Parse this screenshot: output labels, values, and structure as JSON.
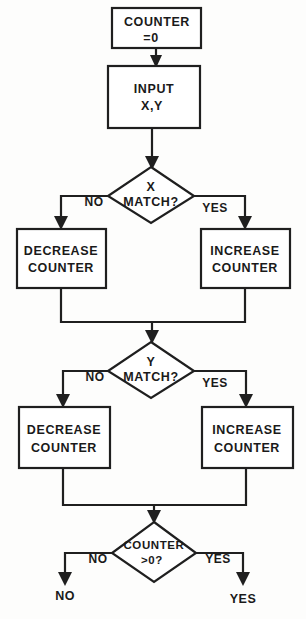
{
  "diagram": {
    "colors": {
      "background": "#fdfdfc",
      "stroke": "#1f1f1f",
      "shape_fill": "#ffffff",
      "text": "#1a1a1a"
    },
    "nodes": {
      "init": {
        "type": "process",
        "line1": "COUNTER",
        "line2": "=0"
      },
      "input": {
        "type": "process",
        "line1": "INPUT",
        "line2": "X,Y"
      },
      "x_match": {
        "type": "decision",
        "line1": "X",
        "line2": "MATCH?"
      },
      "x_no_box": {
        "type": "process",
        "line1": "DECREASE",
        "line2": "COUNTER"
      },
      "x_yes_box": {
        "type": "process",
        "line1": "INCREASE",
        "line2": "COUNTER"
      },
      "y_match": {
        "type": "decision",
        "line1": "Y",
        "line2": "MATCH?"
      },
      "y_no_box": {
        "type": "process",
        "line1": "DECREASE",
        "line2": "COUNTER"
      },
      "y_yes_box": {
        "type": "process",
        "line1": "INCREASE",
        "line2": "COUNTER"
      },
      "counter_gt0": {
        "type": "decision",
        "line1": "COUNTER",
        "line2": ">0?"
      }
    },
    "branch_labels": {
      "x_no": "NO",
      "x_yes": "YES",
      "y_no": "NO",
      "y_yes": "YES",
      "final_no": "NO",
      "final_yes": "YES"
    },
    "terminals": {
      "no": "NO",
      "yes": "YES"
    }
  }
}
